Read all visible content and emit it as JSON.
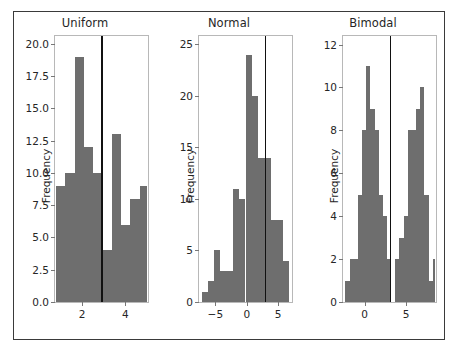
{
  "figure": {
    "background": "#ffffff",
    "border_color": "#3a3a3a",
    "bar_color": "#6e6e6e",
    "vline_color": "#111111",
    "axis_color": "#b8b8b8",
    "tick_color": "#777777",
    "text_color": "#262626"
  },
  "chart_data": [
    {
      "type": "bar",
      "title": "Uniform",
      "xlabel": "",
      "ylabel": "Frequency",
      "xlim": [
        0.75,
        5.05
      ],
      "ylim": [
        0,
        20.6
      ],
      "xticks": [
        2,
        4
      ],
      "xticklabels": [
        "2",
        "4"
      ],
      "yticks": [
        0.0,
        2.5,
        5.0,
        7.5,
        10.0,
        12.5,
        15.0,
        17.5,
        20.0
      ],
      "yticklabels": [
        "0.0",
        "2.5",
        "5.0",
        "7.5",
        "10.0",
        "12.5",
        "15.0",
        "17.5",
        "20.0"
      ],
      "grid": false,
      "legend": "none",
      "bin_edges": [
        0.8,
        1.23,
        1.66,
        2.09,
        2.52,
        2.95,
        3.38,
        3.81,
        4.24,
        4.67,
        5.0
      ],
      "values": [
        9,
        10,
        19,
        12,
        10,
        4,
        13,
        6,
        8,
        9
      ],
      "vline": {
        "x": 2.88,
        "label": "reference-line"
      }
    },
    {
      "type": "bar",
      "title": "Normal",
      "xlabel": "",
      "ylabel": "Frequency",
      "xlim": [
        -7.6,
        7.2
      ],
      "ylim": [
        0,
        25.8
      ],
      "xticks": [
        -5,
        0,
        5
      ],
      "xticklabels": [
        "−5",
        "0",
        "5"
      ],
      "yticks": [
        0,
        5,
        10,
        15,
        20,
        25
      ],
      "yticklabels": [
        "0",
        "5",
        "10",
        "15",
        "20",
        "25"
      ],
      "grid": false,
      "legend": "none",
      "bin_edges": [
        -7.2,
        -6.2,
        -5.2,
        -4.2,
        -3.2,
        -2.2,
        -1.2,
        -0.2,
        0.8,
        1.8,
        2.8,
        3.8,
        4.8,
        5.8,
        6.8
      ],
      "values": [
        1,
        2,
        5,
        3,
        3,
        11,
        10,
        24,
        20,
        14,
        14,
        8,
        8,
        4
      ],
      "vline": {
        "x": 2.85,
        "label": "reference-line"
      }
    },
    {
      "type": "bar",
      "title": "Bimodal",
      "xlabel": "",
      "ylabel": "Frequency",
      "xlim": [
        -2.6,
        8.6
      ],
      "ylim": [
        0,
        12.4
      ],
      "xticks": [
        0,
        5
      ],
      "xticklabels": [
        "0",
        "5"
      ],
      "yticks": [
        0,
        2,
        4,
        6,
        8,
        10,
        12
      ],
      "yticklabels": [
        "0",
        "2",
        "4",
        "6",
        "8",
        "10",
        "12"
      ],
      "grid": false,
      "legend": "none",
      "bin_edges": [
        -2.3,
        -1.8,
        -1.3,
        -0.8,
        -0.3,
        0.2,
        0.7,
        1.2,
        1.7,
        2.2,
        2.7,
        3.2,
        3.7,
        4.2,
        4.7,
        5.2,
        5.7,
        6.2,
        6.7,
        7.2,
        7.7,
        8.2
      ],
      "values": [
        1,
        2,
        2,
        5,
        8,
        11,
        9,
        8,
        5,
        4,
        2,
        0,
        2,
        3,
        4,
        8,
        8,
        9,
        10,
        5,
        1,
        2
      ],
      "vline": {
        "x": 3.0,
        "label": "reference-line"
      }
    }
  ]
}
